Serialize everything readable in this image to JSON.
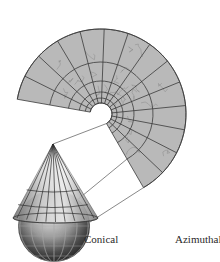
{
  "figure": {
    "labels": {
      "conical": "Conical",
      "azimuthal": "Azimuthal"
    },
    "colors": {
      "fan_fill": "#b9b9b9",
      "grid_line": "#3a3a3a",
      "coast_line": "#8a8a8a",
      "connector_line": "#555555",
      "background": "#ffffff"
    },
    "fan": {
      "center": [
        101,
        114
      ],
      "inner_radius": 11,
      "outer_radius": 85,
      "ring_radii": [
        11,
        16,
        22,
        33,
        52,
        85
      ],
      "start_angle_deg": 190,
      "end_angle_deg": 420,
      "meridian_count": 14
    },
    "cone": {
      "apex": [
        53,
        144
      ],
      "base_y": 218,
      "base_left_x": 13,
      "base_right_x": 98
    },
    "globe": {
      "center": [
        54,
        226
      ],
      "radius": 36
    }
  }
}
